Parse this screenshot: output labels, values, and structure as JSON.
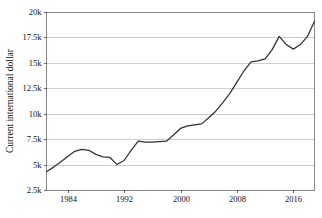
{
  "chart_data": {
    "type": "line",
    "title": "",
    "subtitle": "",
    "xlabel": "",
    "ylabel": "Current international dollar",
    "xlim": [
      1981,
      2019
    ],
    "ylim": [
      2500,
      20000
    ],
    "grid": true,
    "legend": false,
    "legend_position": "none",
    "x_ticks": [
      1984,
      1992,
      2000,
      2008,
      2016
    ],
    "x_tick_labels": [
      "1984",
      "1992",
      "2000",
      "2008",
      "2016"
    ],
    "y_ticks": [
      2500,
      5000,
      7500,
      10000,
      12500,
      15000,
      17500,
      20000
    ],
    "y_tick_labels": [
      "2.5k",
      "5k",
      "7.5k",
      "10k",
      "12.5k",
      "15k",
      "17.5k",
      "20k"
    ],
    "series": [
      {
        "name": "Current international dollar",
        "color": "#303030",
        "x": [
          1981,
          1982,
          1983,
          1984,
          1985,
          1986,
          1987,
          1988,
          1989,
          1990,
          1991,
          1992,
          1993,
          1994,
          1995,
          1996,
          1997,
          1998,
          1999,
          2000,
          2001,
          2002,
          2003,
          2004,
          2005,
          2006,
          2007,
          2008,
          2009,
          2010,
          2011,
          2012,
          2013,
          2014,
          2015,
          2016,
          2017,
          2018,
          2019
        ],
        "values": [
          4300,
          4750,
          5250,
          5800,
          6300,
          6500,
          6400,
          6000,
          5750,
          5700,
          5000,
          5400,
          6400,
          7300,
          7200,
          7200,
          7250,
          7300,
          7900,
          8550,
          8800,
          8900,
          9000,
          9600,
          10250,
          11100,
          12000,
          13100,
          14200,
          15100,
          15200,
          15400,
          16300,
          17600,
          16800,
          16350,
          16800,
          17600,
          19100
        ]
      }
    ]
  }
}
